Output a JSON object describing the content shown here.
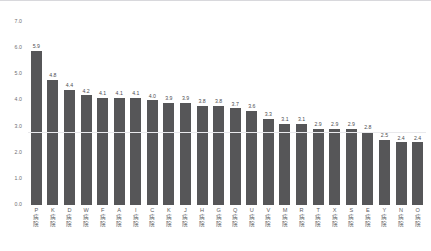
{
  "chart_data": {
    "type": "bar",
    "title": "",
    "subtitle": "",
    "xlabel": "",
    "ylabel": "",
    "ylim": [
      0.0,
      7.0
    ],
    "y_ticks": [
      "7.0",
      "6.0",
      "5.0",
      "4.0",
      "3.0",
      "2.0",
      "1.0",
      "0.0"
    ],
    "y_tick_values": [
      7.0,
      6.0,
      5.0,
      4.0,
      3.0,
      2.0,
      1.0,
      0.0
    ],
    "grid": true,
    "legend": null,
    "legend_position": "none",
    "orientation": "vertical",
    "sorted": "descending",
    "bar_color": "#565658",
    "background_color": "#ffffff",
    "value_label_color": "#4c4c50",
    "axis_label_color": "#6e6e72",
    "gridline_color": "#e9e9ec",
    "category_suffix": "病院",
    "categories": [
      "P病院",
      "K病院",
      "D病院",
      "W病院",
      "F病院",
      "A病院",
      "I病院",
      "C病院",
      "K病院",
      "J病院",
      "H病院",
      "G病院",
      "Q病院",
      "U病院",
      "V病院",
      "M病院",
      "R病院",
      "T病院",
      "X病院",
      "S病院",
      "E病院",
      "Y病院",
      "N病院",
      "O病院"
    ],
    "category_letters": [
      "P",
      "K",
      "D",
      "W",
      "F",
      "A",
      "I",
      "C",
      "K",
      "J",
      "H",
      "G",
      "Q",
      "U",
      "V",
      "M",
      "R",
      "T",
      "X",
      "S",
      "E",
      "Y",
      "N",
      "O"
    ],
    "values": [
      5.9,
      4.8,
      4.4,
      4.2,
      4.1,
      4.1,
      4.1,
      4.0,
      3.9,
      3.9,
      3.8,
      3.8,
      3.7,
      3.6,
      3.3,
      3.1,
      3.1,
      2.9,
      2.9,
      2.9,
      2.8,
      2.5,
      2.4,
      2.4
    ],
    "value_labels": [
      "5.9",
      "4.8",
      "4.4",
      "4.2",
      "4.1",
      "4.1",
      "4.1",
      "4.0",
      "3.9",
      "3.9",
      "3.8",
      "3.8",
      "3.7",
      "3.6",
      "3.3",
      "3.1",
      "3.1",
      "2.9",
      "2.9",
      "2.9",
      "2.8",
      "2.5",
      "2.4",
      "2.4"
    ],
    "reference_line": 2.8
  }
}
